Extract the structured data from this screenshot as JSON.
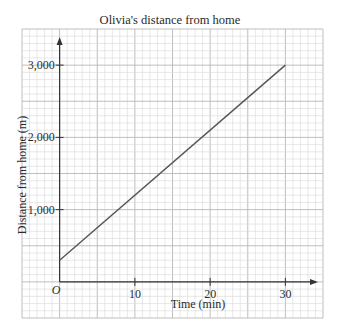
{
  "chart_data": {
    "type": "line",
    "title": "Olivia's distance from home",
    "xlabel": "Time (min)",
    "ylabel": "Distance from home (m)",
    "origin_label": "O",
    "xlim": [
      -5,
      35
    ],
    "ylim": [
      -500,
      3500
    ],
    "x_ticks": [
      10,
      20,
      30
    ],
    "x_tick_labels": [
      "10",
      "20",
      "30"
    ],
    "y_ticks": [
      1000,
      2000,
      3000
    ],
    "y_tick_labels": [
      "1,000",
      "2,000",
      "3,000"
    ],
    "grid": true,
    "grid_minor_x": 1,
    "grid_minor_y": 100,
    "grid_major_x": 5,
    "grid_major_y": 500,
    "series": [
      {
        "name": "Distance",
        "x": [
          0,
          30
        ],
        "y": [
          300,
          3000
        ],
        "color": "#555555"
      }
    ],
    "colors": {
      "grid_minor": "#d6d6d6",
      "grid_major": "#b8b8b8",
      "axis": "#333333"
    }
  }
}
